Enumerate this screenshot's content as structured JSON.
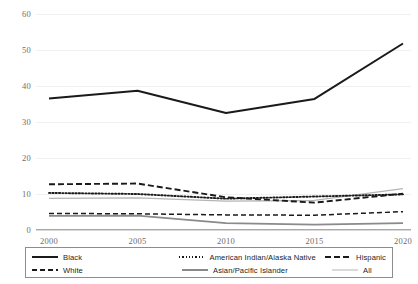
{
  "chart_data": {
    "type": "line",
    "title": "",
    "xlabel": "",
    "ylabel": "",
    "x": [
      2000,
      2005,
      2010,
      2015,
      2020
    ],
    "categories": [
      "2000",
      "2005",
      "2010",
      "2015",
      "2020"
    ],
    "ylim": [
      0,
      60
    ],
    "yticks": [
      0,
      10,
      20,
      30,
      40,
      50,
      60
    ],
    "ytick_labels": [
      "0",
      "10",
      "20",
      "30",
      "40",
      "50",
      "60"
    ],
    "xtick_labels": [
      "2000",
      "2005",
      "2010",
      "2015",
      "2020"
    ],
    "grid": true,
    "legend_position": "bottom",
    "series": [
      {
        "name": "Black",
        "values": [
          36.5,
          38.7,
          32.5,
          36.4,
          51.8
        ],
        "style": "solid",
        "color": "#1a1a1a",
        "width": 2.0,
        "dash": ""
      },
      {
        "name": "American Indian/Alaska Native",
        "values": [
          10.3,
          10.0,
          8.7,
          9.3,
          9.9
        ],
        "style": "dotted",
        "color": "#1a1a1a",
        "width": 1.9,
        "dash": "1.3,2.0"
      },
      {
        "name": "Hispanic",
        "values": [
          12.7,
          12.9,
          9.1,
          7.6,
          10.1
        ],
        "style": "dashed-heavy",
        "color": "#1a1a1a",
        "width": 1.9,
        "dash": "6,3"
      },
      {
        "name": "White",
        "values": [
          4.6,
          4.5,
          4.2,
          4.1,
          5.1
        ],
        "style": "dashed",
        "color": "#1a1a1a",
        "width": 1.5,
        "dash": "5,3"
      },
      {
        "name": "Asian/Pacific Islander",
        "values": [
          3.9,
          4.0,
          1.9,
          1.5,
          1.9
        ],
        "style": "solid-gray",
        "color": "#8a8a8a",
        "width": 1.8,
        "dash": ""
      },
      {
        "name": "All",
        "values": [
          8.8,
          8.9,
          8.0,
          8.2,
          11.5
        ],
        "style": "solid-thin-gray",
        "color": "#b5b5b5",
        "width": 1.3,
        "dash": ""
      }
    ]
  },
  "legend": {
    "items": [
      {
        "label": "Black"
      },
      {
        "label": "American Indian/Alaska Native"
      },
      {
        "label": "Hispanic"
      },
      {
        "label": "White"
      },
      {
        "label": "Asian/Pacific Islander"
      },
      {
        "label": "All"
      }
    ]
  }
}
